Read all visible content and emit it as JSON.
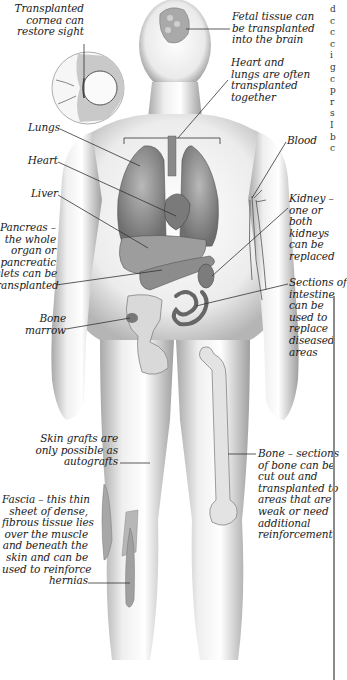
{
  "diagram": {
    "title_fragment": "...transplanted ... ... ...",
    "labels": {
      "cornea": "Transplanted\ncornea can\nrestore sight",
      "fetal_tissue": "Fetal tissue can\nbe transplanted\ninto the brain",
      "heart_lungs": "Heart and\nlungs are often\ntransplanted\ntogether",
      "lungs": "Lungs",
      "heart": "Heart",
      "liver": "Liver",
      "pancreas": "Pancreas –\nthe whole\norgan or\npancreatic\nislets can be\ntransplanted",
      "blood": "Blood",
      "kidney": "Kidney –\none or\nboth\nkidneys\ncan be\nreplaced",
      "intestine": "Sections of\nintestine\ncan be\nused to\nreplace\ndiseased\nareas",
      "bone_marrow": "Bone\nmarrow",
      "skin": "Skin grafts are\nonly possible as\nautografts",
      "bone": "Bone – sections\nof bone can be\ncut out and\ntransplanted to\nareas that are\nweak or need\nadditional\nreinforcement",
      "fascia": "Fascia – this thin\nsheet of dense,\nfibrous tissue lies\nover the muscle\nand beneath the\nskin and can be\nused to reinforce\nhernias"
    },
    "sidebar_fragment": "d\nc\nc\nc\ni\ng\nc\np\nr\ns\nI\nb\nc",
    "colors": {
      "body_fill": "#e9e9e9",
      "body_shadow": "#9a9a9a",
      "organ_fill": "#8f8f8f",
      "leader_line": "#333333",
      "text": "#1a1a1a"
    }
  }
}
